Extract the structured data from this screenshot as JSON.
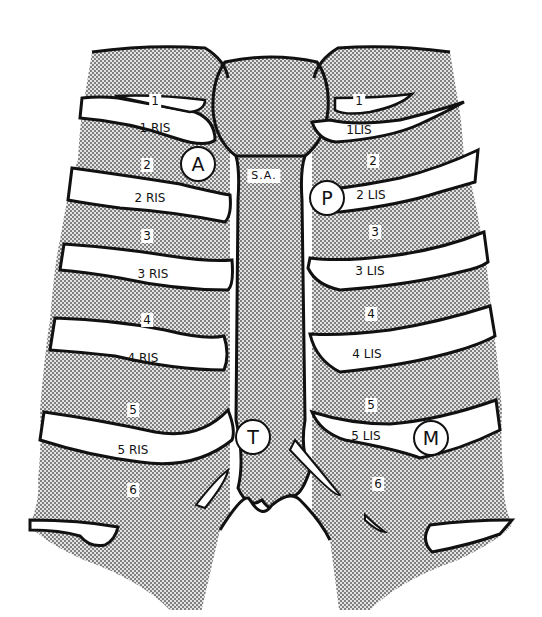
{
  "diagram": {
    "colors": {
      "bone_dots": "#555555",
      "outline": "#111111",
      "space": "#ffffff"
    },
    "sternum_label": "S.A.",
    "right_side": {
      "ribs": [
        "1",
        "2",
        "3",
        "4",
        "5",
        "6"
      ],
      "spaces": [
        "1 RIS",
        "2 RIS",
        "3 RIS",
        "4 RIS",
        "5 RIS"
      ]
    },
    "left_side": {
      "ribs": [
        "1",
        "2",
        "3",
        "4",
        "5",
        "6"
      ],
      "spaces": [
        "1LIS",
        "2 LIS",
        "3 LIS",
        "4 LIS",
        "5 LIS"
      ]
    },
    "points": {
      "aortic": "A",
      "pulmonic": "P",
      "tricuspid": "T",
      "mitral": "M"
    }
  }
}
